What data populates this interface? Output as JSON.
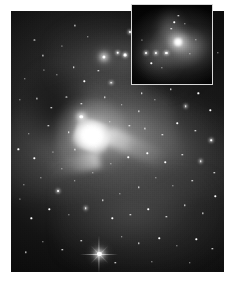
{
  "figure": {
    "kind": "astronomical-image",
    "rendering": "grayscale monochrome photographic plate",
    "page_background": "#ffffff",
    "plate": {
      "background": "#050505",
      "left": 11,
      "top": 11,
      "width": 213,
      "height": 261,
      "highlight_color": "#ffffff",
      "nebula_color": "#b4b4b4",
      "dust_color": "#000000",
      "description": "Wide-field view of the Orion Nebula showing the bright Huygens core, dark dust intrusion, extended nebulosity wings and a dense star field."
    },
    "inset": {
      "left": 131,
      "top": 4,
      "width": 82,
      "height": 81,
      "border_color": "#d8d8d8",
      "border_width": 1,
      "background": "#020202",
      "description": "Zoomed detail panel of the nebula core region with a compact bright knot and a row of three faint stars."
    },
    "stars": {
      "plate": [
        {
          "x": 56.0,
          "y": 8.0,
          "size": 2.0,
          "class": "glow"
        },
        {
          "x": 65.5,
          "y": 9.5,
          "size": 4.0,
          "class": "bigglow",
          "spikes": true
        },
        {
          "x": 43.5,
          "y": 17.5,
          "size": 3.2,
          "class": "bigglow"
        },
        {
          "x": 50.0,
          "y": 16.0,
          "size": 2.6,
          "class": "glow"
        },
        {
          "x": 53.5,
          "y": 17.0,
          "size": 2.8,
          "class": "glow"
        },
        {
          "x": 36.0,
          "y": 10.0,
          "size": 1.4,
          "class": ""
        },
        {
          "x": 30.0,
          "y": 5.5,
          "size": 1.2,
          "class": ""
        },
        {
          "x": 24.0,
          "y": 13.5,
          "size": 1.2,
          "class": ""
        },
        {
          "x": 11.0,
          "y": 11.0,
          "size": 1.2,
          "class": ""
        },
        {
          "x": 6.5,
          "y": 26.0,
          "size": 1.4,
          "class": ""
        },
        {
          "x": 15.5,
          "y": 22.5,
          "size": 1.2,
          "class": ""
        },
        {
          "x": 21.5,
          "y": 24.5,
          "size": 1.3,
          "class": ""
        },
        {
          "x": 29.5,
          "y": 21.5,
          "size": 1.5,
          "class": ""
        },
        {
          "x": 34.5,
          "y": 27.0,
          "size": 1.4,
          "class": ""
        },
        {
          "x": 41.0,
          "y": 23.0,
          "size": 1.3,
          "class": ""
        },
        {
          "x": 47.0,
          "y": 27.5,
          "size": 1.6,
          "class": "glow"
        },
        {
          "x": 58.0,
          "y": 24.0,
          "size": 1.3,
          "class": ""
        },
        {
          "x": 61.5,
          "y": 31.5,
          "size": 1.5,
          "class": ""
        },
        {
          "x": 69.0,
          "y": 20.0,
          "size": 1.2,
          "class": ""
        },
        {
          "x": 4.0,
          "y": 34.0,
          "size": 1.3,
          "class": ""
        },
        {
          "x": 12.0,
          "y": 33.5,
          "size": 1.2,
          "class": ""
        },
        {
          "x": 19.0,
          "y": 37.0,
          "size": 1.4,
          "class": ""
        },
        {
          "x": 26.0,
          "y": 33.0,
          "size": 1.2,
          "class": ""
        },
        {
          "x": 33.0,
          "y": 35.5,
          "size": 1.3,
          "class": ""
        },
        {
          "x": 44.0,
          "y": 33.0,
          "size": 1.4,
          "class": ""
        },
        {
          "x": 52.0,
          "y": 36.0,
          "size": 1.5,
          "class": ""
        },
        {
          "x": 60.0,
          "y": 38.5,
          "size": 1.3,
          "class": ""
        },
        {
          "x": 67.5,
          "y": 34.0,
          "size": 1.3,
          "class": ""
        },
        {
          "x": 75.0,
          "y": 30.0,
          "size": 1.4,
          "class": ""
        },
        {
          "x": 82.0,
          "y": 36.5,
          "size": 1.6,
          "class": "glow"
        },
        {
          "x": 88.0,
          "y": 31.5,
          "size": 1.3,
          "class": ""
        },
        {
          "x": 93.5,
          "y": 38.0,
          "size": 1.4,
          "class": ""
        },
        {
          "x": 78.0,
          "y": 43.0,
          "size": 1.5,
          "class": ""
        },
        {
          "x": 86.5,
          "y": 46.0,
          "size": 1.3,
          "class": ""
        },
        {
          "x": 94.0,
          "y": 49.5,
          "size": 1.6,
          "class": "glow"
        },
        {
          "x": 71.0,
          "y": 47.5,
          "size": 1.3,
          "class": ""
        },
        {
          "x": 63.0,
          "y": 45.0,
          "size": 1.2,
          "class": ""
        },
        {
          "x": 55.5,
          "y": 44.0,
          "size": 1.3,
          "class": ""
        },
        {
          "x": 46.5,
          "y": 42.5,
          "size": 1.4,
          "class": ""
        },
        {
          "x": 36.0,
          "y": 44.0,
          "size": 1.3,
          "class": ""
        },
        {
          "x": 27.0,
          "y": 46.5,
          "size": 1.5,
          "class": ""
        },
        {
          "x": 17.5,
          "y": 44.0,
          "size": 1.3,
          "class": ""
        },
        {
          "x": 8.5,
          "y": 47.0,
          "size": 1.4,
          "class": ""
        },
        {
          "x": 3.5,
          "y": 53.0,
          "size": 1.3,
          "class": ""
        },
        {
          "x": 11.0,
          "y": 56.5,
          "size": 1.4,
          "class": ""
        },
        {
          "x": 19.5,
          "y": 54.0,
          "size": 1.2,
          "class": ""
        },
        {
          "x": 33.0,
          "y": 40.5,
          "size": 3.4,
          "class": "bigglow"
        },
        {
          "x": 24.0,
          "y": 60.5,
          "size": 1.3,
          "class": ""
        },
        {
          "x": 30.0,
          "y": 65.0,
          "size": 1.5,
          "class": ""
        },
        {
          "x": 22.0,
          "y": 69.0,
          "size": 1.9,
          "class": "glow"
        },
        {
          "x": 14.0,
          "y": 64.0,
          "size": 1.3,
          "class": ""
        },
        {
          "x": 6.0,
          "y": 66.5,
          "size": 1.3,
          "class": ""
        },
        {
          "x": 38.5,
          "y": 62.0,
          "size": 1.4,
          "class": ""
        },
        {
          "x": 47.0,
          "y": 58.5,
          "size": 1.3,
          "class": ""
        },
        {
          "x": 55.0,
          "y": 56.0,
          "size": 1.5,
          "class": ""
        },
        {
          "x": 64.0,
          "y": 54.5,
          "size": 1.4,
          "class": ""
        },
        {
          "x": 72.5,
          "y": 58.0,
          "size": 1.5,
          "class": ""
        },
        {
          "x": 80.5,
          "y": 55.0,
          "size": 1.4,
          "class": ""
        },
        {
          "x": 89.0,
          "y": 57.5,
          "size": 1.6,
          "class": "glow"
        },
        {
          "x": 95.5,
          "y": 62.0,
          "size": 1.4,
          "class": ""
        },
        {
          "x": 85.0,
          "y": 65.0,
          "size": 1.5,
          "class": ""
        },
        {
          "x": 76.0,
          "y": 67.0,
          "size": 1.3,
          "class": ""
        },
        {
          "x": 68.0,
          "y": 64.0,
          "size": 1.3,
          "class": ""
        },
        {
          "x": 60.0,
          "y": 67.5,
          "size": 1.4,
          "class": ""
        },
        {
          "x": 51.0,
          "y": 70.0,
          "size": 1.3,
          "class": ""
        },
        {
          "x": 43.0,
          "y": 72.5,
          "size": 1.4,
          "class": ""
        },
        {
          "x": 35.0,
          "y": 75.5,
          "size": 1.6,
          "class": "glow"
        },
        {
          "x": 27.0,
          "y": 78.0,
          "size": 1.3,
          "class": ""
        },
        {
          "x": 18.0,
          "y": 76.0,
          "size": 1.4,
          "class": ""
        },
        {
          "x": 9.5,
          "y": 79.5,
          "size": 1.3,
          "class": ""
        },
        {
          "x": 4.0,
          "y": 72.0,
          "size": 1.2,
          "class": ""
        },
        {
          "x": 47.5,
          "y": 79.5,
          "size": 1.4,
          "class": ""
        },
        {
          "x": 56.0,
          "y": 78.0,
          "size": 1.3,
          "class": ""
        },
        {
          "x": 64.5,
          "y": 76.0,
          "size": 1.5,
          "class": ""
        },
        {
          "x": 73.0,
          "y": 79.0,
          "size": 1.3,
          "class": ""
        },
        {
          "x": 81.5,
          "y": 74.5,
          "size": 1.4,
          "class": ""
        },
        {
          "x": 90.0,
          "y": 77.5,
          "size": 1.3,
          "class": ""
        },
        {
          "x": 96.0,
          "y": 71.0,
          "size": 1.4,
          "class": ""
        },
        {
          "x": 41.5,
          "y": 93.0,
          "size": 4.2,
          "class": "bigglow",
          "spikes": true
        },
        {
          "x": 52.0,
          "y": 86.5,
          "size": 1.5,
          "class": ""
        },
        {
          "x": 60.0,
          "y": 89.0,
          "size": 1.4,
          "class": ""
        },
        {
          "x": 69.5,
          "y": 87.0,
          "size": 1.5,
          "class": ""
        },
        {
          "x": 78.0,
          "y": 90.0,
          "size": 1.3,
          "class": ""
        },
        {
          "x": 87.0,
          "y": 87.5,
          "size": 1.4,
          "class": ""
        },
        {
          "x": 94.5,
          "y": 91.0,
          "size": 1.3,
          "class": ""
        },
        {
          "x": 33.0,
          "y": 88.0,
          "size": 1.5,
          "class": ""
        },
        {
          "x": 24.0,
          "y": 91.5,
          "size": 1.4,
          "class": ""
        },
        {
          "x": 15.0,
          "y": 88.5,
          "size": 1.3,
          "class": ""
        },
        {
          "x": 7.0,
          "y": 92.5,
          "size": 1.3,
          "class": ""
        },
        {
          "x": 49.0,
          "y": 96.5,
          "size": 1.4,
          "class": ""
        },
        {
          "x": 66.0,
          "y": 96.0,
          "size": 1.3,
          "class": ""
        },
        {
          "x": 84.0,
          "y": 96.5,
          "size": 1.4,
          "class": ""
        },
        {
          "x": 97.0,
          "y": 16.0,
          "size": 1.3,
          "class": ""
        },
        {
          "x": 91.0,
          "y": 22.0,
          "size": 1.2,
          "class": ""
        },
        {
          "x": 76.0,
          "y": 14.0,
          "size": 1.2,
          "class": ""
        },
        {
          "x": 30.0,
          "y": 53.0,
          "size": 1.2,
          "class": ""
        },
        {
          "x": 40.0,
          "y": 52.0,
          "size": 1.3,
          "class": ""
        },
        {
          "x": 15.0,
          "y": 17.0,
          "size": 1.2,
          "class": ""
        }
      ],
      "inset": [
        {
          "x": 17.0,
          "y": 61.0,
          "size": 2.0,
          "class": "glow"
        },
        {
          "x": 30.0,
          "y": 61.0,
          "size": 2.2,
          "class": "glow"
        },
        {
          "x": 43.0,
          "y": 61.0,
          "size": 2.2,
          "class": "glow"
        },
        {
          "x": 24.0,
          "y": 74.0,
          "size": 1.4,
          "class": ""
        },
        {
          "x": 37.0,
          "y": 80.0,
          "size": 1.3,
          "class": ""
        },
        {
          "x": 49.0,
          "y": 30.0,
          "size": 1.5,
          "class": ""
        },
        {
          "x": 53.0,
          "y": 22.0,
          "size": 1.5,
          "class": ""
        },
        {
          "x": 58.0,
          "y": 14.0,
          "size": 1.3,
          "class": ""
        },
        {
          "x": 66.0,
          "y": 24.0,
          "size": 1.3,
          "class": ""
        },
        {
          "x": 72.0,
          "y": 62.0,
          "size": 1.3,
          "class": ""
        },
        {
          "x": 80.0,
          "y": 44.0,
          "size": 1.3,
          "class": ""
        },
        {
          "x": 12.0,
          "y": 44.0,
          "size": 1.2,
          "class": ""
        }
      ]
    }
  }
}
